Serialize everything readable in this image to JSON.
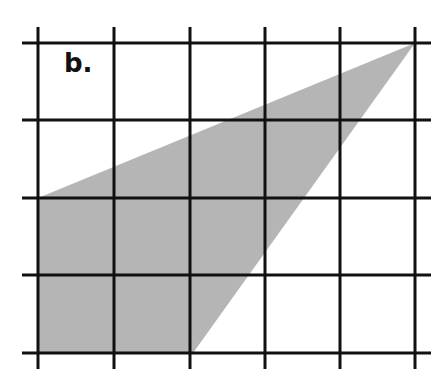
{
  "figure": {
    "label": "b.",
    "background": "#ffffff",
    "grid": {
      "columns": 5,
      "rows": 4,
      "x_lines": [
        38,
        114,
        190,
        265,
        340,
        415
      ],
      "y_lines": [
        43,
        120,
        198,
        275,
        353
      ],
      "line_color": "#111111",
      "line_width": 3
    },
    "shaded_region": {
      "shape": "quadrilateral",
      "fill": "#b5b5b5",
      "vertices": [
        [
          38,
          198
        ],
        [
          415,
          43
        ],
        [
          193,
          353
        ],
        [
          38,
          353
        ]
      ],
      "grid_vertices": [
        [
          0,
          2
        ],
        [
          5,
          0
        ],
        [
          2,
          4
        ],
        [
          0,
          4
        ]
      ]
    }
  }
}
